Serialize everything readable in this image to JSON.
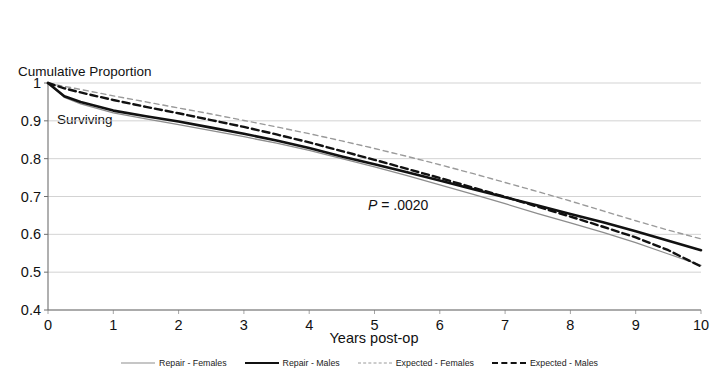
{
  "chart_data": {
    "type": "line",
    "title": "Cumulative Proportion Surviving",
    "title_line1": "Cumulative Proportion",
    "title_line2": "Surviving",
    "xlabel": "Years post-op",
    "ylabel": "",
    "xlim": [
      0,
      10
    ],
    "ylim": [
      0.4,
      1.0
    ],
    "grid": true,
    "legend_position": "bottom",
    "xticks": [
      "0",
      "1",
      "2",
      "3",
      "4",
      "5",
      "6",
      "7",
      "8",
      "9",
      "10"
    ],
    "yticks": [
      "0.4",
      "0.5",
      "0.6",
      "0.7",
      "0.8",
      "0.9",
      "1"
    ],
    "annotations": [
      {
        "text_italic": "P",
        "text": " = .0020",
        "x": 4.9,
        "y": 0.665
      }
    ],
    "x": [
      0,
      0.25,
      0.5,
      1,
      1.5,
      2,
      2.5,
      3,
      3.5,
      4,
      4.5,
      5,
      5.5,
      6,
      6.5,
      7,
      7.5,
      8,
      8.5,
      9,
      9.5,
      10
    ],
    "series": [
      {
        "name": "Repair - Females",
        "style": "solid-thin",
        "color": "#8d8d8d",
        "width": 1.3,
        "values": [
          1.0,
          0.962,
          0.945,
          0.921,
          0.905,
          0.89,
          0.874,
          0.858,
          0.841,
          0.822,
          0.8,
          0.778,
          0.755,
          0.731,
          0.706,
          0.681,
          0.655,
          0.63,
          0.605,
          0.578,
          0.548,
          0.518
        ]
      },
      {
        "name": "Repair - Males",
        "style": "solid-thick",
        "color": "#111111",
        "width": 2.6,
        "values": [
          1.0,
          0.965,
          0.95,
          0.927,
          0.912,
          0.898,
          0.882,
          0.866,
          0.848,
          0.828,
          0.806,
          0.785,
          0.764,
          0.742,
          0.72,
          0.698,
          0.676,
          0.654,
          0.632,
          0.608,
          0.583,
          0.558
        ]
      },
      {
        "name": "Expected - Females",
        "style": "dashed-thin",
        "color": "#9a9a9a",
        "width": 1.4,
        "values": [
          1.0,
          0.991,
          0.983,
          0.966,
          0.95,
          0.934,
          0.918,
          0.901,
          0.884,
          0.866,
          0.847,
          0.827,
          0.806,
          0.784,
          0.761,
          0.737,
          0.713,
          0.688,
          0.662,
          0.636,
          0.611,
          0.588
        ]
      },
      {
        "name": "Expected - Males",
        "style": "dashed-thick",
        "color": "#111111",
        "width": 2.4,
        "values": [
          1.0,
          0.986,
          0.975,
          0.955,
          0.937,
          0.92,
          0.902,
          0.884,
          0.864,
          0.843,
          0.82,
          0.797,
          0.773,
          0.749,
          0.724,
          0.699,
          0.673,
          0.647,
          0.62,
          0.592,
          0.558,
          0.515
        ]
      }
    ]
  },
  "legend": {
    "items": [
      {
        "label": "Repair - Females"
      },
      {
        "label": "Repair - Males"
      },
      {
        "label": "Expected - Females"
      },
      {
        "label": "Expected - Males"
      }
    ]
  }
}
